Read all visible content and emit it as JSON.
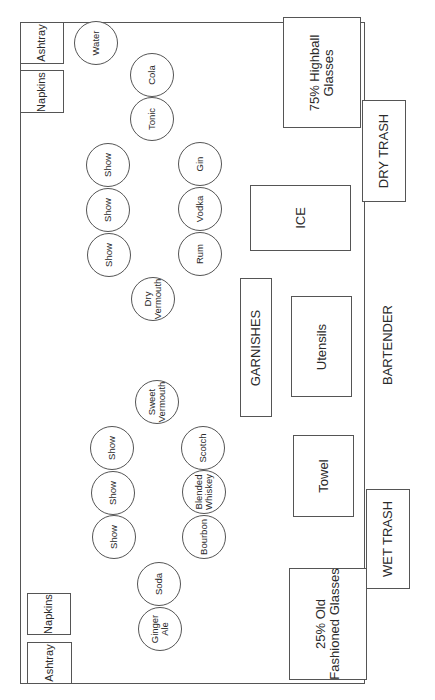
{
  "diagram": {
    "type": "bar-station-layout",
    "bar_counter": {
      "corner_items_top": {
        "ashtray": "Ashtray",
        "napkins": "Napkins"
      },
      "corner_items_bottom": {
        "napkins": "Napkins",
        "ashtray": "Ashtray"
      }
    },
    "bottles": {
      "water": "Water",
      "cola": "Cola",
      "tonic": "Tonic",
      "show_top": [
        "Show",
        "Show",
        "Show"
      ],
      "well_top": [
        "Gin",
        "Vodka",
        "Rum"
      ],
      "dry_vermouth": "Dry\nVermouth",
      "sweet_vermouth": "Sweet\nVermouth",
      "show_bottom": [
        "Show",
        "Show",
        "Show"
      ],
      "well_bottom": [
        "Scotch",
        "Blended\nWhiskey",
        "Bourbon"
      ],
      "soda": "Soda",
      "ginger_ale": "Ginger\nAle"
    },
    "stations": {
      "highball": "75% Highball\nGlasses",
      "ice": "ICE",
      "garnishes": "GARNISHES",
      "utensils": "Utensils",
      "towel": "Towel",
      "old_fashioned": "25% Old\nFashioned Glasses"
    },
    "outside": {
      "dry_trash": "DRY TRASH",
      "wet_trash": "WET TRASH",
      "bartender": "BARTENDER"
    }
  }
}
